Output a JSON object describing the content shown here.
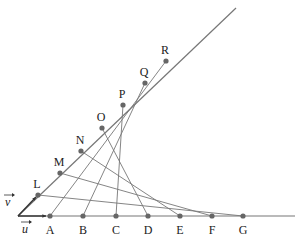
{
  "diagram": {
    "origin": {
      "x": 18,
      "y": 216
    },
    "base_line_end": {
      "x": 295,
      "y": 216
    },
    "slant_line_end": {
      "x": 236,
      "y": 8
    },
    "vectors": {
      "u": {
        "label": "u",
        "from": [
          18,
          216
        ],
        "to": [
          46,
          216
        ],
        "label_pos": [
          22,
          233
        ]
      },
      "v": {
        "label": "v",
        "from": [
          18,
          216
        ],
        "to": [
          36,
          197
        ],
        "label_pos": [
          5,
          206
        ]
      }
    },
    "base_points": [
      {
        "label": "A",
        "x": 50,
        "y": 216
      },
      {
        "label": "B",
        "x": 83,
        "y": 216
      },
      {
        "label": "C",
        "x": 116,
        "y": 216
      },
      {
        "label": "D",
        "x": 148,
        "y": 216
      },
      {
        "label": "E",
        "x": 180,
        "y": 216
      },
      {
        "label": "F",
        "x": 212,
        "y": 216
      },
      {
        "label": "G",
        "x": 243,
        "y": 216
      }
    ],
    "slant_points": [
      {
        "label": "L",
        "x": 38,
        "y": 195
      },
      {
        "label": "M",
        "x": 60,
        "y": 173
      },
      {
        "label": "N",
        "x": 81,
        "y": 151
      },
      {
        "label": "O",
        "x": 102,
        "y": 128
      },
      {
        "label": "P",
        "x": 123,
        "y": 105
      },
      {
        "label": "Q",
        "x": 145,
        "y": 83
      },
      {
        "label": "R",
        "x": 166,
        "y": 61
      }
    ],
    "connections": [
      [
        "L",
        "G"
      ],
      [
        "M",
        "F"
      ],
      [
        "N",
        "E"
      ],
      [
        "O",
        "D"
      ],
      [
        "P",
        "C"
      ],
      [
        "Q",
        "B"
      ],
      [
        "R",
        "A"
      ]
    ],
    "colors": {
      "line": "#777777",
      "point": "#666666",
      "text": "#222222"
    }
  }
}
